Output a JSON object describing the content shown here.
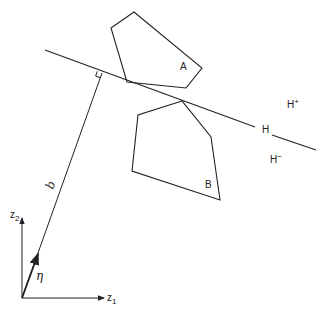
{
  "diagram": {
    "type": "separating-hyperplane",
    "stroke_color": "#222222",
    "background": "#ffffff",
    "polygons": [
      {
        "label": "A",
        "points": "134,12 111,28 127,82 186,88 202,68",
        "label_pos": [
          180,
          70
        ]
      },
      {
        "label": "B",
        "points": "182,101 138,115 132,171 220,200 211,137",
        "label_pos": [
          205,
          188
        ]
      }
    ],
    "hyperplane": {
      "label": "H",
      "label_pos": [
        262,
        133
      ],
      "segment1": [
        45,
        50,
        255,
        127
      ],
      "segment2": [
        272,
        135,
        316,
        150
      ]
    },
    "halfspaces": {
      "positive": {
        "label": "H",
        "sup": "+",
        "pos": [
          287,
          108
        ]
      },
      "negative": {
        "label": "H",
        "sup": "−",
        "pos": [
          270,
          163
        ]
      }
    },
    "normal_line": {
      "label": "b",
      "from": [
        22,
        298
      ],
      "to": [
        102,
        73
      ],
      "label_pos": [
        53,
        190
      ],
      "right_angle_marker": true
    },
    "normal_vector": {
      "label": "η",
      "from": [
        22,
        298
      ],
      "to": [
        38,
        254
      ],
      "label_pos": [
        36,
        280
      ]
    },
    "axes": {
      "origin": [
        22,
        298
      ],
      "z1": {
        "label": "z",
        "sub": "1",
        "end": [
          104,
          298
        ],
        "label_pos": [
          107,
          301
        ]
      },
      "z2": {
        "label": "z",
        "sub": "2",
        "end": [
          22,
          218
        ],
        "label_pos": [
          10,
          218
        ]
      }
    }
  }
}
